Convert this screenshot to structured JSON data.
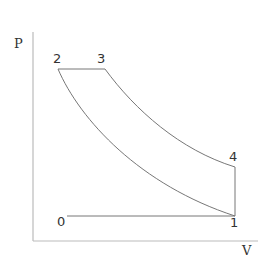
{
  "diagram": {
    "type": "PV diagram",
    "axes": {
      "y_label": "P",
      "x_label": "V"
    },
    "points": [
      {
        "id": "0",
        "label": "0"
      },
      {
        "id": "1",
        "label": "1"
      },
      {
        "id": "2",
        "label": "2"
      },
      {
        "id": "3",
        "label": "3"
      },
      {
        "id": "4",
        "label": "4"
      }
    ],
    "colors": {
      "axis": "#bbbbbb",
      "curve": "#777777",
      "text": "#333333"
    }
  }
}
